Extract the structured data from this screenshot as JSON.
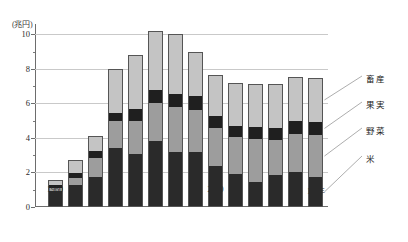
{
  "chart_data": {
    "type": "bar",
    "stacked": true,
    "title": "",
    "subtitle": "",
    "xlabel": "",
    "ylabel": "",
    "unit_label": "(兆円)",
    "year_suffix": "年",
    "grid": true,
    "legend_position": "right",
    "ylim": [
      0,
      10.6
    ],
    "yticks": [
      0,
      2,
      4,
      6,
      8,
      10
    ],
    "yticklabels": [
      "0",
      "2",
      "4",
      "6",
      "8",
      "10"
    ],
    "yminorticks": [
      1,
      3,
      5,
      7,
      9
    ],
    "categories": [
      "1960",
      "65",
      "70",
      "75",
      "80",
      "85",
      "90",
      "95",
      "2000",
      "05",
      "10",
      "11",
      "12",
      "13"
    ],
    "series": [
      {
        "name": "米",
        "key": "rice",
        "color": "#2a2a2a",
        "values": [
          0.9,
          1.25,
          1.75,
          3.4,
          3.05,
          3.8,
          3.2,
          3.2,
          2.35,
          1.9,
          1.45,
          1.85,
          2.0,
          1.75
        ]
      },
      {
        "name": "野菜",
        "key": "veg",
        "color": "#9d9d9d",
        "values": [
          0.2,
          0.45,
          1.1,
          1.6,
          1.95,
          2.25,
          2.6,
          2.4,
          2.25,
          2.15,
          2.5,
          2.05,
          2.25,
          2.4
        ]
      },
      {
        "name": "果実",
        "key": "fruit",
        "color": "#1f1f1f",
        "values": [
          0.15,
          0.25,
          0.4,
          0.45,
          0.65,
          0.7,
          0.75,
          0.85,
          0.65,
          0.65,
          0.7,
          0.7,
          0.75,
          0.8
        ]
      },
      {
        "name": "畜産",
        "key": "畜産_live",
        "color": "#c4c4c4",
        "values": [
          0.3,
          0.75,
          0.85,
          2.55,
          3.15,
          3.45,
          3.45,
          2.55,
          2.4,
          2.5,
          2.5,
          2.55,
          2.55,
          2.5
        ]
      }
    ],
    "totals": [
      1.55,
      2.7,
      4.1,
      8.0,
      8.8,
      10.2,
      9.95,
      9.0,
      7.65,
      7.2,
      7.15,
      7.2,
      7.55,
      7.45
    ]
  },
  "legend": [
    {
      "label": "畜産",
      "key": "live"
    },
    {
      "label": "果実",
      "key": "fruit"
    },
    {
      "label": "野菜",
      "key": "veg"
    },
    {
      "label": "米",
      "key": "rice"
    }
  ]
}
